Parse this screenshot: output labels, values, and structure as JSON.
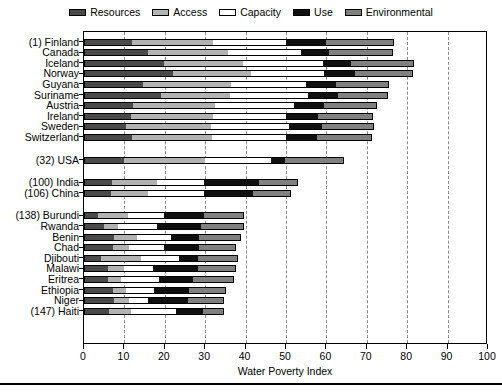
{
  "chart_data": {
    "type": "bar",
    "orientation": "horizontal",
    "stacked": true,
    "title": "",
    "xlabel": "Water Poverty Index",
    "ylabel": "",
    "xlim": [
      0,
      100
    ],
    "xticks": [
      0,
      10,
      20,
      30,
      40,
      50,
      60,
      70,
      80,
      90,
      100
    ],
    "grid": "vertical-dashed",
    "legend_position": "top-center",
    "components": [
      "Resources",
      "Access",
      "Capacity",
      "Use",
      "Environmental"
    ],
    "component_colors": [
      "#4a4a4a",
      "#b3b3b3",
      "#ffffff",
      "#101010",
      "#808080"
    ],
    "categories": [
      "(1) Finland",
      "Canada",
      "Iceland",
      "Norway",
      "Guyana",
      "Suriname",
      "Austria",
      "Ireland",
      "Sweden",
      "Switzerland",
      "(32) USA",
      "(100) India",
      "(106) China",
      "(138) Burundi",
      "Rwanda",
      "Benin",
      "Chad",
      "Djibouti",
      "Malawi",
      "Eritrea",
      "Ethiopia",
      "Niger",
      "(147) Haiti"
    ],
    "group_gaps_after": [
      "Switzerland",
      "(32) USA",
      "(106) China"
    ],
    "series": [
      {
        "name": "Resources",
        "values": [
          11.8,
          15.8,
          19.9,
          22.0,
          14.5,
          19.1,
          12.2,
          11.6,
          10.5,
          11.9,
          10.0,
          6.9,
          6.7,
          3.4,
          5.0,
          7.5,
          7.1,
          4.2,
          5.9,
          6.0,
          7.1,
          7.5,
          6.3
        ]
      },
      {
        "name": "Access",
        "values": [
          20.1,
          19.8,
          19.4,
          19.3,
          22.0,
          17.0,
          20.3,
          20.3,
          21.0,
          19.9,
          20.0,
          11.2,
          9.1,
          7.4,
          3.3,
          5.6,
          4.1,
          9.9,
          4.1,
          3.2,
          3.3,
          3.6,
          5.3
        ]
      },
      {
        "name": "Capacity",
        "values": [
          18.1,
          18.1,
          19.8,
          18.0,
          18.5,
          19.3,
          19.4,
          18.2,
          19.3,
          18.2,
          16.3,
          11.7,
          13.8,
          9.1,
          9.8,
          8.4,
          8.7,
          9.5,
          7.0,
          9.4,
          7.0,
          4.7,
          11.2
        ]
      },
      {
        "name": "Use",
        "values": [
          10.0,
          7.0,
          7.0,
          7.8,
          7.3,
          7.5,
          7.4,
          7.9,
          8.0,
          7.6,
          3.5,
          13.6,
          12.2,
          9.9,
          10.8,
          7.0,
          8.6,
          4.5,
          11.1,
          8.3,
          8.6,
          9.9,
          6.6
        ]
      },
      {
        "name": "Environmental",
        "values": [
          16.8,
          15.7,
          15.5,
          14.3,
          13.2,
          12.4,
          13.2,
          13.6,
          13.0,
          13.7,
          14.6,
          9.5,
          9.4,
          9.9,
          10.8,
          10.4,
          9.1,
          9.9,
          9.5,
          10.3,
          9.1,
          9.0,
          5.3
        ]
      }
    ],
    "totals": [
      76.8,
      76.4,
      81.6,
      81.4,
      75.5,
      75.3,
      72.5,
      71.6,
      71.8,
      71.3,
      64.4,
      52.9,
      51.2,
      39.7,
      39.7,
      38.9,
      37.6,
      38.0,
      37.6,
      37.2,
      35.1,
      34.7,
      34.7
    ]
  },
  "legend": {
    "items": [
      {
        "label": "Resources",
        "color": "#4a4a4a"
      },
      {
        "label": "Access",
        "color": "#b3b3b3"
      },
      {
        "label": "Capacity",
        "color": "#ffffff"
      },
      {
        "label": "Use",
        "color": "#101010"
      },
      {
        "label": "Environmental",
        "color": "#808080"
      }
    ]
  },
  "axis": {
    "x_title": "Water Poverty Index",
    "x_ticklabels": [
      "0",
      "10",
      "20",
      "30",
      "40",
      "50",
      "60",
      "70",
      "80",
      "90",
      "100"
    ]
  }
}
